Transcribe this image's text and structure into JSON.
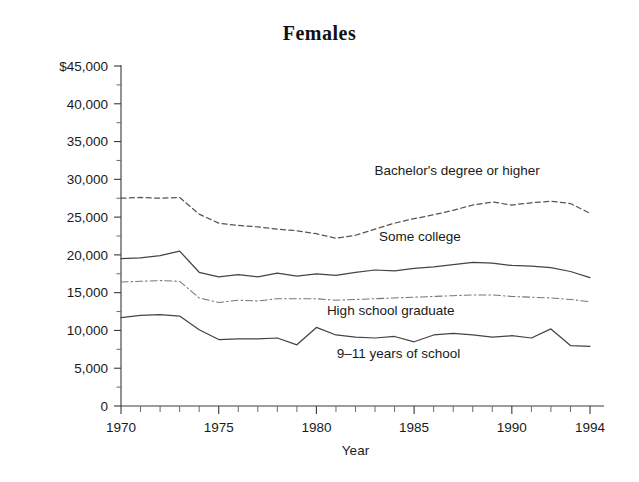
{
  "chart_data": {
    "type": "line",
    "title": "Females",
    "xlabel": "Year",
    "ylabel": "",
    "xlim": [
      1970,
      1994
    ],
    "ylim": [
      0,
      45000
    ],
    "grid": false,
    "legend_position": "inline-annotations",
    "x": [
      1970,
      1971,
      1972,
      1973,
      1974,
      1975,
      1976,
      1977,
      1978,
      1979,
      1980,
      1981,
      1982,
      1983,
      1984,
      1985,
      1986,
      1987,
      1988,
      1989,
      1990,
      1991,
      1992,
      1993,
      1994
    ],
    "xticks_major": [
      1970,
      1975,
      1980,
      1985,
      1990,
      1994
    ],
    "xtick_labels": [
      "1970",
      "1975",
      "1980",
      "1985",
      "1990",
      "1994"
    ],
    "yticks_major": [
      0,
      5000,
      10000,
      15000,
      20000,
      25000,
      30000,
      35000,
      40000,
      45000
    ],
    "ytick_labels": [
      "0",
      "5,000",
      "10,000",
      "15,000",
      "20,000",
      "25,000",
      "30,000",
      "35,000",
      "40,000",
      "$45,000"
    ],
    "yticks_minor": [
      2500,
      7500,
      12500,
      17500,
      22500,
      27500,
      32500,
      37500,
      42500
    ],
    "series": [
      {
        "name": "Bachelor's degree or higher",
        "style": "dashed",
        "color": "#555555",
        "label_x": 1987.2,
        "label_y": 30600,
        "values": [
          27500,
          27600,
          27500,
          27600,
          25400,
          24200,
          23900,
          23700,
          23400,
          23200,
          22800,
          22200,
          22600,
          23400,
          24200,
          24800,
          25300,
          25900,
          26600,
          27000,
          26600,
          26900,
          27100,
          26800,
          25500
        ]
      },
      {
        "name": "Some college",
        "style": "solid",
        "color": "#444444",
        "label_x": 1985.3,
        "label_y": 21900,
        "values": [
          19500,
          19600,
          19900,
          20500,
          17700,
          17100,
          17400,
          17100,
          17600,
          17200,
          17500,
          17300,
          17700,
          18000,
          17900,
          18200,
          18400,
          18700,
          19000,
          18900,
          18600,
          18500,
          18300,
          17800,
          17000
        ]
      },
      {
        "name": "High school graduate",
        "style": "dashdot",
        "color": "#777777",
        "label_x": 1983.8,
        "label_y": 12000,
        "values": [
          16400,
          16500,
          16600,
          16500,
          14300,
          13700,
          14000,
          13900,
          14200,
          14200,
          14200,
          14000,
          14100,
          14200,
          14300,
          14400,
          14500,
          14600,
          14700,
          14700,
          14500,
          14400,
          14300,
          14100,
          13800
        ]
      },
      {
        "name": "9–11 years of school",
        "style": "solid",
        "color": "#444444",
        "label_x": 1984.2,
        "label_y": 6400,
        "values": [
          11700,
          12000,
          12100,
          11900,
          10100,
          8800,
          8900,
          8900,
          9000,
          8100,
          10400,
          9400,
          9100,
          9000,
          9200,
          8500,
          9400,
          9600,
          9400,
          9100,
          9300,
          9000,
          10200,
          8000,
          7900
        ]
      }
    ]
  }
}
